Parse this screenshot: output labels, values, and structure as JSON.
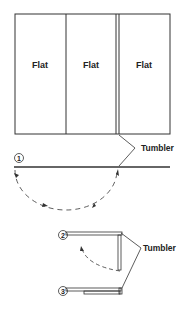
{
  "diagram": {
    "panels": [
      {
        "label": "Flat"
      },
      {
        "label": "Flat"
      },
      {
        "label": "Flat"
      }
    ],
    "tumbler_label_1": "Tumbler",
    "tumbler_label_2": "Tumbler",
    "steps": [
      {
        "label": "1"
      },
      {
        "label": "2"
      },
      {
        "label": "3"
      }
    ]
  }
}
